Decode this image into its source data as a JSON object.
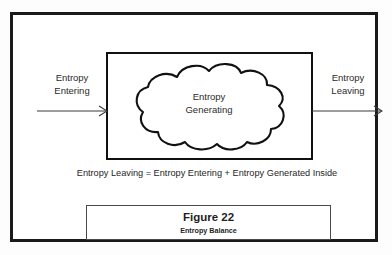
{
  "figure": {
    "cloud": {
      "line1": "Entropy",
      "line2": "Generating"
    },
    "inlet": {
      "line1": "Entropy",
      "line2": "Entering"
    },
    "outlet": {
      "line1": "Entropy",
      "line2": "Leaving"
    },
    "equation": "Entropy Leaving = Entropy Entering + Entropy Generated Inside",
    "caption": {
      "title": "Figure 22",
      "subtitle": "Entropy Balance"
    },
    "colors": {
      "outer_frame": "#1a1a1a",
      "system_box": "#111111",
      "cloud_stroke": "#111111",
      "arrow": "#3a3a3a",
      "caption_border": "#4a4a4a",
      "text": "#262626",
      "background": "#ffffff"
    }
  }
}
